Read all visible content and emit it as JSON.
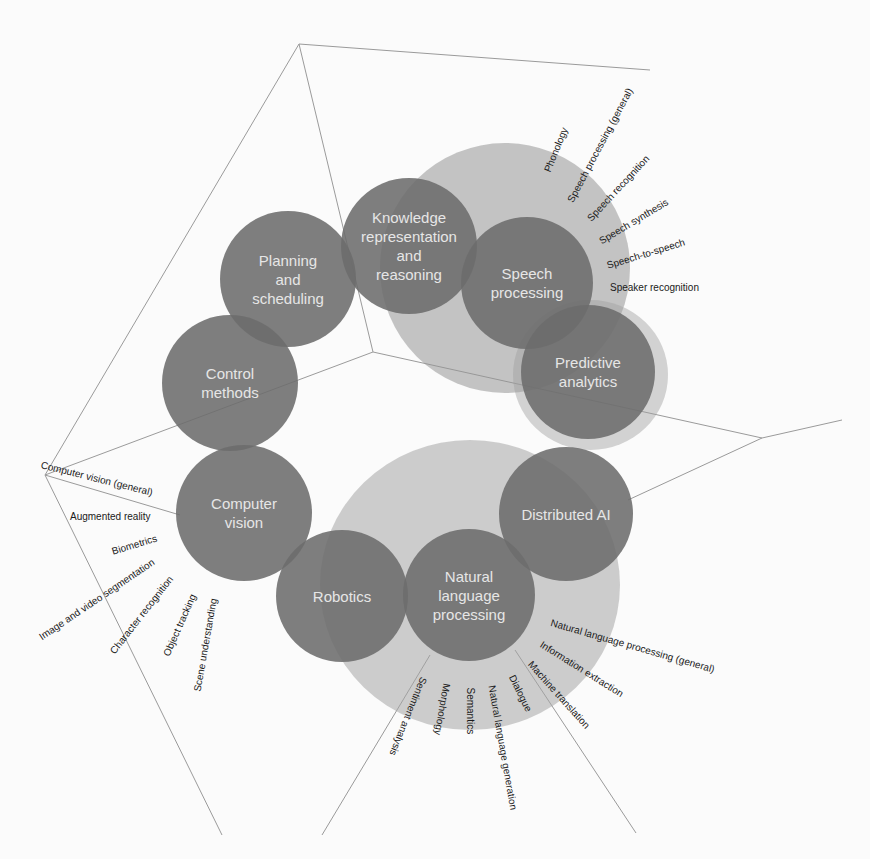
{
  "diagram": {
    "type": "ai-subfield-cluster-diagram",
    "colors": {
      "background": "#fbfbfb",
      "circle_fill": "#6c6c6c",
      "circle_text": "#e6e6e6",
      "halo_fill": "#b9b9b9",
      "halo_fill_light": "#a9a9a9",
      "line_color": "#9a9a9a",
      "label_text": "#1a1a1a"
    },
    "circles": [
      {
        "id": "knowledge",
        "label": "Knowledge representation and reasoning"
      },
      {
        "id": "planning",
        "label": "Planning and scheduling"
      },
      {
        "id": "speech",
        "label": "Speech processing"
      },
      {
        "id": "control",
        "label": "Control methods"
      },
      {
        "id": "predictive",
        "label": "Predictive analytics"
      },
      {
        "id": "vision",
        "label": "Computer vision"
      },
      {
        "id": "distributed",
        "label": "Distributed AI"
      },
      {
        "id": "robotics",
        "label": "Robotics"
      },
      {
        "id": "nlp",
        "label": "Natural language processing"
      }
    ],
    "speech_subfields": [
      "Phonology",
      "Speech processing (general)",
      "Speech recognition",
      "Speech synthesis",
      "Speech-to-speech",
      "Speaker recognition"
    ],
    "vision_subfields": [
      "Computer vision (general)",
      "Augmented reality",
      "Biometrics",
      "Image and video segmentation",
      "Character recognition",
      "Object tracking",
      "Scene understanding"
    ],
    "nlp_subfields": [
      "Natural language processing (general)",
      "Information extraction",
      "Machine translation",
      "Dialogue",
      "Natural language generation",
      "Semantics",
      "Morphology",
      "Sentiment analysis"
    ],
    "circle_text": {
      "knowledge": [
        "Knowledge",
        "representation",
        "and",
        "reasoning"
      ],
      "planning": [
        "Planning",
        "and",
        "scheduling"
      ],
      "speech": [
        "Speech",
        "processing"
      ],
      "control": [
        "Control",
        "methods"
      ],
      "predictive": [
        "Predictive",
        "analytics"
      ],
      "vision": [
        "Computer",
        "vision"
      ],
      "distributed": [
        "Distributed AI"
      ],
      "robotics": [
        "Robotics"
      ],
      "nlp": [
        "Natural",
        "language",
        "processing"
      ]
    }
  }
}
